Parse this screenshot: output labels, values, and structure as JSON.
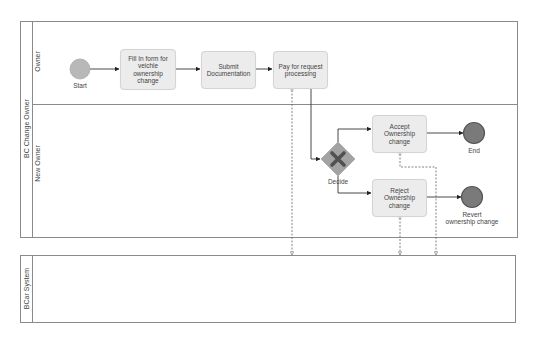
{
  "diagram": {
    "type": "bpmn",
    "pools": [
      {
        "id": "pool-bc-change-owner",
        "label": "BC Change Owner",
        "lanes": [
          {
            "id": "lane-owner",
            "label": "Owner"
          },
          {
            "id": "lane-new-owner",
            "label": "New Owner"
          }
        ]
      },
      {
        "id": "pool-bcar-system",
        "label": "BCar System",
        "lanes": []
      }
    ],
    "events": {
      "start": {
        "label": "Start",
        "kind": "start"
      },
      "end": {
        "label": "End",
        "kind": "end"
      },
      "revert": {
        "label": "Revert\nownership change",
        "label_line1": "Revert",
        "label_line2": "ownership change",
        "kind": "end"
      }
    },
    "tasks": {
      "fill_form": {
        "label": "Fill In  form for veichle ownership change"
      },
      "submit_docs": {
        "label": "Submit Documentation"
      },
      "pay": {
        "label": "Pay for request processing"
      },
      "accept": {
        "label": "Accept Ownership change"
      },
      "reject": {
        "label": "Reject Ownership change"
      }
    },
    "gateways": {
      "decide": {
        "label": "Decide",
        "kind": "exclusive"
      }
    },
    "sequence_flows": [
      {
        "from": "Start",
        "to": "Fill In  form for veichle ownership change"
      },
      {
        "from": "Fill In  form for veichle ownership change",
        "to": "Submit Documentation"
      },
      {
        "from": "Submit Documentation",
        "to": "Pay for request processing"
      },
      {
        "from": "Pay for request processing",
        "to": "Decide"
      },
      {
        "from": "Decide",
        "to": "Accept Ownership change"
      },
      {
        "from": "Decide",
        "to": "Reject Ownership change"
      },
      {
        "from": "Accept Ownership change",
        "to": "End"
      },
      {
        "from": "Reject Ownership change",
        "to": "Revert ownership change"
      }
    ],
    "message_flows": [
      {
        "from": "Pay for request processing",
        "to": "BCar System"
      },
      {
        "from": "Accept Ownership change",
        "to": "BCar System"
      },
      {
        "from": "Reject Ownership change",
        "to": "BCar System"
      }
    ],
    "colors": {
      "pool_border": "#8a8a8a",
      "task_fill": "#ececec",
      "task_border": "#d4d4d4",
      "start_fill": "#b8b8b8",
      "end_fill": "#7a7a7a",
      "end_border": "#555555",
      "gateway_fill": "#a3a3a3",
      "gateway_mark": "#505050",
      "flow_line": "#333333",
      "message_line": "#666666"
    }
  }
}
